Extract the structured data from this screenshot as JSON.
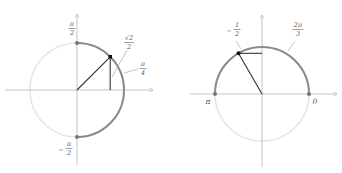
{
  "diagrams": [
    {
      "name": "unit-circle-sin-pi-over-4",
      "labels": {
        "top": {
          "num": "π",
          "den": "2",
          "sign": ""
        },
        "bottom": {
          "num": "π",
          "den": "2",
          "sign": "−"
        },
        "value": {
          "num": "√2",
          "den": "2",
          "sign": ""
        },
        "angle": {
          "num": "π",
          "den": "4",
          "sign": ""
        }
      }
    },
    {
      "name": "unit-circle-cos-2pi-over-3",
      "labels": {
        "value": {
          "num": "1",
          "den": "2",
          "sign": "−"
        },
        "angle": {
          "num": "2π",
          "den": "3",
          "sign": ""
        },
        "left": "π",
        "right": "0"
      }
    }
  ],
  "colors": {
    "light_circle": "#e6e6e6",
    "highlight_arc": "#8a8a8a",
    "axes": "#b5b5b5",
    "lines": "#333333",
    "point": "#111111",
    "label": "#555555"
  }
}
